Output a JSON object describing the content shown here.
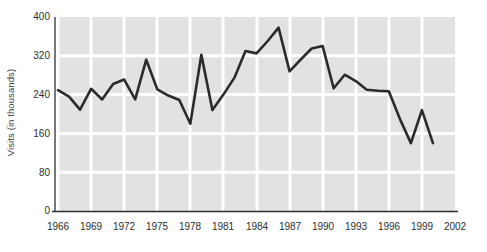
{
  "chart_data": {
    "type": "line",
    "title": "",
    "subtitle": "",
    "xlabel": "",
    "ylabel": "Visits (in thousands)",
    "xlim": [
      1965,
      2002
    ],
    "ylim": [
      0,
      400
    ],
    "yticks": [
      0,
      80,
      160,
      240,
      320,
      400
    ],
    "xticks": [
      1966,
      1969,
      1972,
      1975,
      1978,
      1981,
      1984,
      1987,
      1990,
      1993,
      1996,
      1999,
      2002
    ],
    "grid": true,
    "legend": null,
    "line_color": "#2b2b2b",
    "plot_bg_color": "#e2e2e2",
    "grid_color": "#ffffff",
    "page_bg_color": "#ffffff",
    "x": [
      1966,
      1967,
      1968,
      1969,
      1970,
      1971,
      1972,
      1973,
      1974,
      1975,
      1976,
      1977,
      1978,
      1979,
      1980,
      1981,
      1982,
      1983,
      1984,
      1985,
      1986,
      1987,
      1988,
      1989,
      1990,
      1991,
      1992,
      1993,
      1994,
      1995,
      1996,
      1997,
      1998,
      1999,
      2000
    ],
    "values": [
      249,
      236,
      209,
      252,
      230,
      262,
      271,
      230,
      312,
      251,
      238,
      229,
      180,
      322,
      208,
      240,
      275,
      330,
      325,
      350,
      378,
      288,
      312,
      335,
      340,
      253,
      281,
      268,
      250,
      248,
      247,
      190,
      140,
      208,
      140
    ],
    "series": [
      {
        "name": "Visits",
        "values": [
          249,
          236,
          209,
          252,
          230,
          262,
          271,
          230,
          312,
          251,
          238,
          229,
          180,
          322,
          208,
          240,
          275,
          330,
          325,
          350,
          378,
          288,
          312,
          335,
          340,
          253,
          281,
          268,
          250,
          248,
          247,
          190,
          140,
          208,
          140
        ]
      }
    ]
  },
  "axes": {
    "y_label": "Visits (in thousands)",
    "y_tick_labels": [
      "400",
      "320",
      "240",
      "160",
      "80",
      "0"
    ],
    "x_tick_labels": [
      "1966",
      "1969",
      "1972",
      "1975",
      "1978",
      "1981",
      "1984",
      "1987",
      "1990",
      "1993",
      "1996",
      "1999",
      "2002"
    ]
  }
}
